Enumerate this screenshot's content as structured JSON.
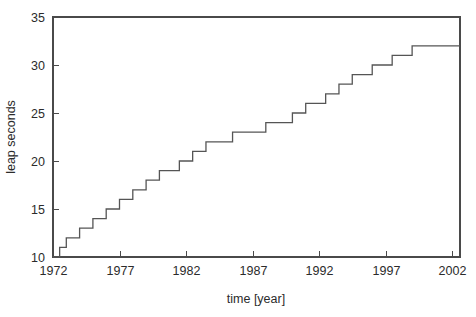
{
  "chart_data": {
    "type": "line",
    "title": "",
    "xlabel": "time [year]",
    "ylabel": "leap seconds",
    "xlim": [
      1972.0,
      2002.6
    ],
    "ylim": [
      10,
      35
    ],
    "grid": false,
    "legend": null,
    "step_style": "post",
    "xticks": [
      1972,
      1977,
      1982,
      1987,
      1992,
      1997,
      2002
    ],
    "xtick_labels": [
      "1972",
      "1977",
      "1982",
      "1987",
      "1992",
      "1997",
      "2002"
    ],
    "yticks": [
      10,
      15,
      20,
      25,
      30,
      35
    ],
    "ytick_labels": [
      "10",
      "15",
      "20",
      "25",
      "30",
      "35"
    ],
    "series": [
      {
        "name": "leap seconds",
        "color": "#555555",
        "x": [
          1972.0,
          1972.5,
          1973.0,
          1974.0,
          1975.0,
          1976.0,
          1977.0,
          1978.0,
          1979.0,
          1980.0,
          1981.5,
          1982.5,
          1983.5,
          1985.5,
          1988.0,
          1990.0,
          1991.0,
          1992.5,
          1993.5,
          1994.5,
          1996.0,
          1997.5,
          1999.0,
          2002.6
        ],
        "y": [
          10,
          11,
          12,
          13,
          14,
          15,
          16,
          17,
          18,
          19,
          20,
          21,
          22,
          23,
          24,
          25,
          26,
          27,
          28,
          29,
          30,
          31,
          32,
          32
        ]
      }
    ]
  },
  "axes": {
    "x_axis_label": "time [year]",
    "y_axis_label": "leap seconds"
  },
  "colors": {
    "line": "#555555",
    "frame": "#4a4a4a",
    "text": "#2b2b2b",
    "background": "#ffffff"
  }
}
